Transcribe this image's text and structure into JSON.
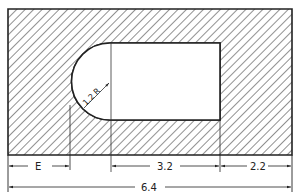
{
  "diagram": {
    "type": "engineering-drawing",
    "colors": {
      "line": "#222222",
      "hatch": "#555555",
      "background": "#ffffff"
    },
    "plate": {
      "x": 8,
      "y": 9,
      "width": 284,
      "height": 146
    },
    "slot": {
      "arc_center_x": 110,
      "center_y": 81.5,
      "radius": 38.5,
      "right_x": 220,
      "top_y": 43,
      "bottom_y": 120
    },
    "labels": {
      "radius": "1.2 R",
      "e_dim": "E",
      "slot_length": "3.2",
      "right_margin": "2.2",
      "overall_width": "6.4"
    }
  }
}
